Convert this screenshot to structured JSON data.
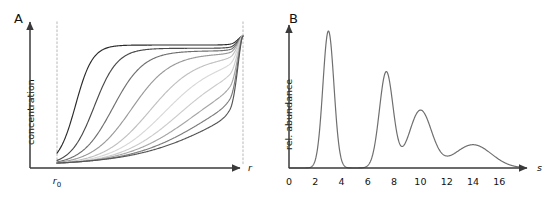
{
  "figure": {
    "background": "#ffffff",
    "axis_color": "#3a3a3a",
    "dash_color": "#c8c8c8",
    "curve_color": "#6f6f6f"
  },
  "panel_a": {
    "letter": "A",
    "ylabel": "concentration",
    "xlabel": "r",
    "meniscus_label_text": "r",
    "meniscus_label_sub": "0",
    "axis": {
      "x_origin": 30,
      "y_origin": 168,
      "x_end": 240,
      "y_top": 22,
      "meniscus_x": 57,
      "bottom_x": 243
    },
    "chart_data": {
      "type": "line",
      "title": "",
      "xlabel": "r",
      "ylabel": "concentration",
      "xlim": [
        0,
        1
      ],
      "ylim": [
        0,
        1
      ],
      "grid": false,
      "legend": "none",
      "description": "Family of sedimentation-velocity boundary profiles; concentration vs radius at increasing times. Each successive curve is shifted toward larger r, plateau height slightly decreasing by radial dilution, with steep back-diffusion rise at the cell bottom.",
      "x": [
        0.0,
        0.05,
        0.1,
        0.15,
        0.2,
        0.25,
        0.3,
        0.35,
        0.4,
        0.45,
        0.5,
        0.55,
        0.6,
        0.65,
        0.7,
        0.75,
        0.8,
        0.85,
        0.9,
        0.95,
        1.0
      ],
      "series": [
        {
          "name": "t1",
          "midpoint": 0.1,
          "steepness": 22,
          "plateau": 0.93,
          "shade": "#2b2b2b",
          "values": [
            0.0,
            0.33,
            0.66,
            0.85,
            0.9,
            0.92,
            0.925,
            0.928,
            0.929,
            0.93,
            0.93,
            0.93,
            0.93,
            0.93,
            0.93,
            0.93,
            0.93,
            0.931,
            0.934,
            0.95,
            1.0
          ]
        },
        {
          "name": "t2",
          "midpoint": 0.2,
          "steepness": 16,
          "plateau": 0.905,
          "shade": "#4a4a4a",
          "values": [
            0.0,
            0.1,
            0.3,
            0.58,
            0.76,
            0.84,
            0.88,
            0.895,
            0.9,
            0.903,
            0.904,
            0.905,
            0.905,
            0.905,
            0.905,
            0.905,
            0.905,
            0.906,
            0.909,
            0.93,
            1.0
          ]
        },
        {
          "name": "t3",
          "midpoint": 0.3,
          "steepness": 12,
          "plateau": 0.885,
          "shade": "#707070",
          "values": [
            0.0,
            0.04,
            0.12,
            0.27,
            0.46,
            0.63,
            0.75,
            0.82,
            0.855,
            0.87,
            0.878,
            0.882,
            0.884,
            0.885,
            0.885,
            0.885,
            0.885,
            0.886,
            0.89,
            0.915,
            1.0
          ]
        },
        {
          "name": "t4",
          "midpoint": 0.4,
          "steepness": 9.5,
          "plateau": 0.865,
          "shade": "#9a9a9a",
          "values": [
            0.0,
            0.02,
            0.06,
            0.13,
            0.25,
            0.4,
            0.55,
            0.68,
            0.77,
            0.82,
            0.845,
            0.857,
            0.862,
            0.864,
            0.865,
            0.865,
            0.866,
            0.867,
            0.872,
            0.9,
            1.0
          ]
        },
        {
          "name": "t5",
          "midpoint": 0.5,
          "steepness": 8,
          "plateau": 0.845,
          "shade": "#c0c0c0",
          "values": [
            0.0,
            0.01,
            0.035,
            0.08,
            0.15,
            0.25,
            0.37,
            0.5,
            0.61,
            0.7,
            0.77,
            0.81,
            0.83,
            0.838,
            0.842,
            0.844,
            0.845,
            0.847,
            0.854,
            0.885,
            1.0
          ]
        },
        {
          "name": "t6",
          "midpoint": 0.58,
          "steepness": 7,
          "plateau": 0.825,
          "shade": "#d8d8d8",
          "values": [
            0.0,
            0.008,
            0.025,
            0.055,
            0.1,
            0.17,
            0.26,
            0.36,
            0.47,
            0.57,
            0.66,
            0.73,
            0.78,
            0.805,
            0.817,
            0.822,
            0.825,
            0.828,
            0.838,
            0.872,
            1.0
          ]
        },
        {
          "name": "t7",
          "midpoint": 0.66,
          "steepness": 6.2,
          "plateau": 0.8,
          "shade": "#cccccc",
          "values": [
            0.0,
            0.006,
            0.018,
            0.04,
            0.075,
            0.125,
            0.19,
            0.27,
            0.36,
            0.45,
            0.54,
            0.63,
            0.7,
            0.75,
            0.78,
            0.795,
            0.8,
            0.806,
            0.818,
            0.858,
            1.0
          ]
        },
        {
          "name": "t8",
          "midpoint": 0.74,
          "steepness": 5.4,
          "plateau": 0.77,
          "shade": "#a6a6a6",
          "values": [
            0.0,
            0.004,
            0.013,
            0.03,
            0.055,
            0.09,
            0.14,
            0.2,
            0.27,
            0.35,
            0.43,
            0.51,
            0.59,
            0.65,
            0.7,
            0.74,
            0.76,
            0.77,
            0.788,
            0.838,
            1.0
          ]
        },
        {
          "name": "t9",
          "midpoint": 0.82,
          "steepness": 4.8,
          "plateau": 0.735,
          "shade": "#7d7d7d",
          "values": [
            0.0,
            0.003,
            0.01,
            0.022,
            0.04,
            0.065,
            0.1,
            0.145,
            0.2,
            0.26,
            0.33,
            0.4,
            0.47,
            0.545,
            0.61,
            0.66,
            0.7,
            0.722,
            0.748,
            0.812,
            1.0
          ]
        },
        {
          "name": "t10",
          "midpoint": 0.9,
          "steepness": 4.2,
          "plateau": 0.7,
          "shade": "#555555",
          "values": [
            0.0,
            0.002,
            0.008,
            0.017,
            0.03,
            0.048,
            0.072,
            0.103,
            0.142,
            0.19,
            0.245,
            0.305,
            0.37,
            0.44,
            0.51,
            0.575,
            0.635,
            0.675,
            0.705,
            0.79,
            1.0
          ]
        }
      ]
    }
  },
  "panel_b": {
    "letter": "B",
    "ylabel": "rel. abundance",
    "xlabel": "s",
    "tick_labels": [
      "0",
      "2",
      "4",
      "6",
      "8",
      "10",
      "12",
      "14",
      "16"
    ],
    "axis": {
      "x_origin": 289,
      "y_origin": 168,
      "x_end": 527,
      "y_top": 25
    },
    "chart_data": {
      "type": "line",
      "title": "",
      "xlabel": "s",
      "ylabel": "rel. abundance",
      "xlim": [
        0,
        17.5
      ],
      "ylim": [
        0,
        1.05
      ],
      "xticks": [
        0,
        2,
        4,
        6,
        8,
        10,
        12,
        14,
        16
      ],
      "grid": false,
      "legend": "none",
      "description": "Continuous sedimentation-coefficient distribution c(s) with four resolved species; peak width increases and amplitude decreases with increasing s.",
      "peaks": [
        {
          "name": "peak-1",
          "center": 3.0,
          "height": 1.0,
          "width": 0.42
        },
        {
          "name": "peak-2",
          "center": 7.4,
          "height": 0.7,
          "width": 0.52
        },
        {
          "name": "peak-3",
          "center": 10.0,
          "height": 0.42,
          "width": 0.85
        },
        {
          "name": "peak-4",
          "center": 14.0,
          "height": 0.17,
          "width": 1.4
        }
      ]
    }
  }
}
